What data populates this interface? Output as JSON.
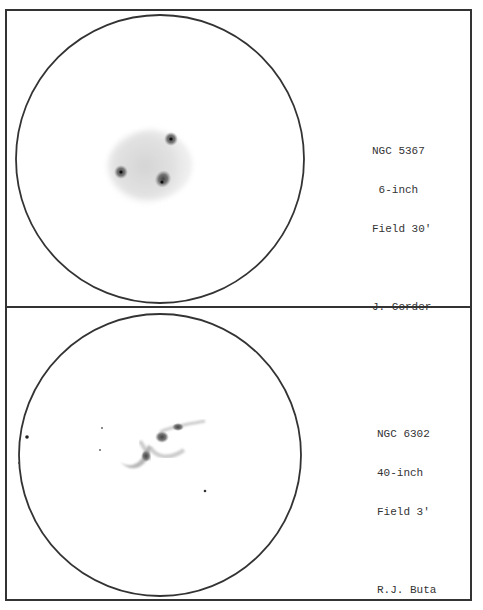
{
  "panels": [
    {
      "object": "NGC 5367",
      "aperture": " 6-inch",
      "field": "Field 30'",
      "observer": "J. Corder"
    },
    {
      "object": "NGC 6302",
      "aperture": "40-inch",
      "field": "Field 3'",
      "observer": "R.J. Buta"
    }
  ]
}
